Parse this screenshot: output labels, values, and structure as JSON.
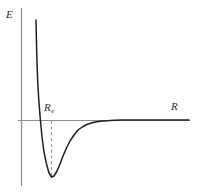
{
  "figure": {
    "type": "potential-energy-curve",
    "background_color": "#ffffff",
    "axis_color": "#8c8c8c",
    "curve_color": "#1f1f1f",
    "dash_color": "#9a9a9a",
    "label_color": "#2b2b2b"
  },
  "labels": {
    "y_axis": "E",
    "x_axis": "R",
    "equilibrium_symbol": "R",
    "equilibrium_subscript": "e"
  },
  "chart_data": {
    "type": "line",
    "title": "",
    "xlabel": "R",
    "ylabel": "E",
    "grid": false,
    "legend": null,
    "axis_origin_px": [
      21,
      120
    ],
    "xlim": [
      0,
      198
    ],
    "ylim": [
      -1.0,
      1.6
    ],
    "annotations": [
      {
        "name": "equilibrium-distance",
        "text": "R_e",
        "x_px": 51,
        "y_px": 120,
        "dashed_line_to_y_px": 177
      }
    ],
    "zero_line": {
      "name": "R-axis",
      "y_px": 120,
      "x_start_px": 18,
      "x_end_px": 190
    },
    "series": [
      {
        "name": "Morse potential",
        "comment": "Repulsive wall rises steeply near small R; minimum at R_e; asymptotically approaches E = 0 at large R",
        "points_px": [
          [
            36,
            20
          ],
          [
            36.4,
            40
          ],
          [
            37,
            62
          ],
          [
            37.8,
            84
          ],
          [
            39,
            103
          ],
          [
            40.4,
            120
          ],
          [
            42,
            137
          ],
          [
            44,
            152
          ],
          [
            46.5,
            164
          ],
          [
            49,
            173
          ],
          [
            51.5,
            177
          ],
          [
            54,
            176
          ],
          [
            57,
            171
          ],
          [
            60,
            164
          ],
          [
            63,
            156
          ],
          [
            66.5,
            148
          ],
          [
            70,
            141
          ],
          [
            74,
            135
          ],
          [
            78,
            130
          ],
          [
            83,
            126.5
          ],
          [
            88,
            124
          ],
          [
            94,
            122.3
          ],
          [
            100,
            121.3
          ],
          [
            107,
            120.7
          ],
          [
            114,
            120.3
          ],
          [
            122,
            120.1
          ],
          [
            132,
            120.0
          ],
          [
            145,
            120.0
          ],
          [
            160,
            120.0
          ],
          [
            175,
            120.0
          ],
          [
            189,
            120.0
          ]
        ]
      }
    ]
  }
}
